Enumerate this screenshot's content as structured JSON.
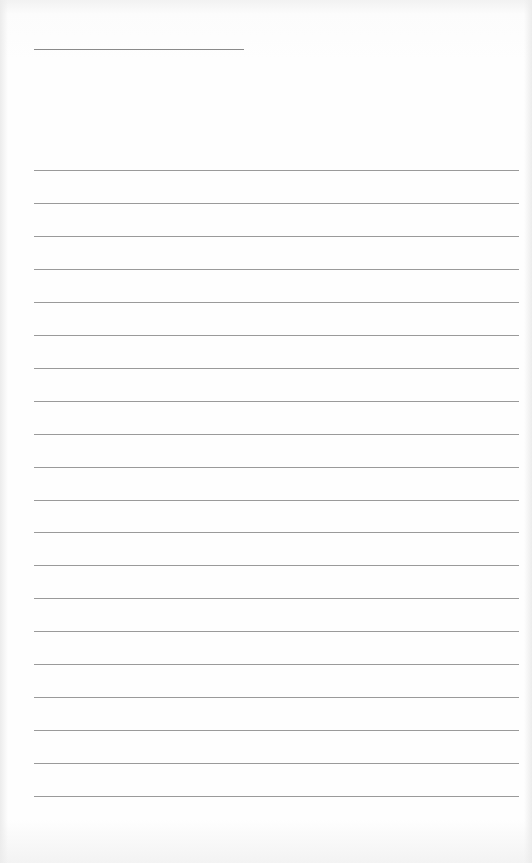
{
  "document": {
    "type": "lined-paper",
    "title_line": {
      "present": true,
      "text": ""
    },
    "rules_count": 20,
    "rules": [
      "",
      "",
      "",
      "",
      "",
      "",
      "",
      "",
      "",
      "",
      "",
      "",
      "",
      "",
      "",
      "",
      "",
      "",
      "",
      ""
    ]
  },
  "colors": {
    "paper": "#fefefe",
    "rule": "#9a9a9a"
  }
}
